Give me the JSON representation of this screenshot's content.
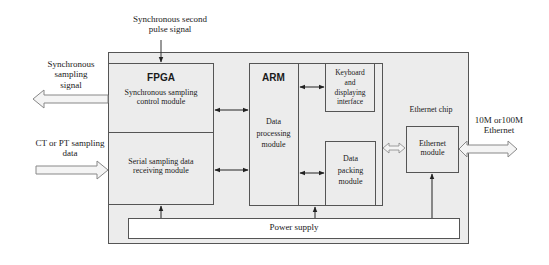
{
  "diagram": {
    "top_input": {
      "label_line1": "Synchronous second",
      "label_line2": "pulse signal"
    },
    "left_output": {
      "label_line1": "Synchronous",
      "label_line2": "sampling",
      "label_line3": "signal"
    },
    "left_input": {
      "label_line1": "CT or PT sampling",
      "label_line2": "data"
    },
    "right_output": {
      "label_line1": "10M or100M",
      "label_line2": "Ethernet"
    },
    "fpga": {
      "title": "FPGA",
      "module1_line1": "Synchronous sampling",
      "module1_line2": "control module",
      "module2_line1": "Serial sampling data",
      "module2_line2": "receiving module"
    },
    "arm": {
      "title": "ARM",
      "core_line1": "Data",
      "core_line2": "processing",
      "core_line3": "module",
      "keyboard_line1": "Keyboard",
      "keyboard_line2": "and",
      "keyboard_line3": "displaying",
      "keyboard_line4": "interface",
      "packing_line1": "Data",
      "packing_line2": "packing",
      "packing_line3": "module"
    },
    "ethernet": {
      "chip_label": "Ethernet chip",
      "module_line1": "Ethernet",
      "module_line2": "module"
    },
    "power": {
      "label": "Power supply"
    },
    "colors": {
      "block_fill": "#ececec",
      "line": "#555555",
      "arrow_fill": "#f4f4f4",
      "background": "#ffffff"
    }
  }
}
